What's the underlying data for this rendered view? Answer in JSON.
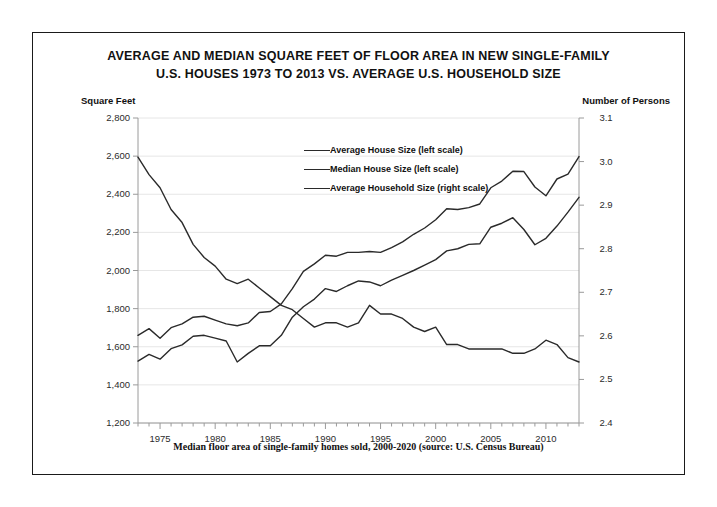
{
  "title": {
    "line1": "AVERAGE AND MEDIAN SQUARE FEET OF FLOOR AREA IN NEW SINGLE-FAMILY",
    "line2": "U.S. HOUSES 1973 TO 2013 VS. AVERAGE U.S. HOUSEHOLD SIZE"
  },
  "axis_captions": {
    "left": "Square Feet",
    "right": "Number of Persons"
  },
  "footer": "Median floor area of single-family homes sold, 2000-2020 (source: U.S. Census Bureau)",
  "colors": {
    "line": "#2a2a2a",
    "grid": "#e6e6e6",
    "axis": "#9a9a9a",
    "frame": "#1a1a1a",
    "text": "#111111"
  },
  "chart_data": {
    "type": "line",
    "title": "AVERAGE AND MEDIAN SQUARE FEET OF FLOOR AREA IN NEW SINGLE-FAMILY U.S. HOUSES 1973 TO 2013 VS. AVERAGE U.S. HOUSEHOLD SIZE",
    "xlabel": "",
    "ylabel": "Square Feet",
    "y2label": "Number of Persons",
    "grid": true,
    "legend_position": "inside-top-center",
    "xlim": [
      1973,
      2013
    ],
    "ylim": [
      1200,
      2800
    ],
    "y2lim": [
      2.4,
      3.1
    ],
    "yticks": [
      "1,200",
      "1,400",
      "1,600",
      "1,800",
      "2,000",
      "2,200",
      "2,400",
      "2,600",
      "2,800"
    ],
    "ytick_values": [
      1200,
      1400,
      1600,
      1800,
      2000,
      2200,
      2400,
      2600,
      2800
    ],
    "y2ticks": [
      "2.4",
      "2.5",
      "2.6",
      "2.7",
      "2.8",
      "2.9",
      "3.0",
      "3.1"
    ],
    "y2tick_values": [
      2.4,
      2.5,
      2.6,
      2.7,
      2.8,
      2.9,
      3.0,
      3.1
    ],
    "xticks": [
      "1975",
      "1980",
      "1985",
      "1990",
      "1995",
      "2000",
      "2005",
      "2010"
    ],
    "xtick_values": [
      1975,
      1980,
      1985,
      1990,
      1995,
      2000,
      2005,
      2010
    ],
    "x": [
      1973,
      1974,
      1975,
      1976,
      1977,
      1978,
      1979,
      1980,
      1981,
      1982,
      1983,
      1984,
      1985,
      1986,
      1987,
      1988,
      1989,
      1990,
      1991,
      1992,
      1993,
      1994,
      1995,
      1996,
      1997,
      1998,
      1999,
      2000,
      2001,
      2002,
      2003,
      2004,
      2005,
      2006,
      2007,
      2008,
      2009,
      2010,
      2011,
      2012,
      2013
    ],
    "series": [
      {
        "name": "Average House Size (left scale)",
        "axis": "left",
        "units": "square feet",
        "values": [
          1660,
          1695,
          1645,
          1700,
          1720,
          1755,
          1760,
          1740,
          1720,
          1710,
          1725,
          1780,
          1785,
          1825,
          1905,
          1995,
          2035,
          2080,
          2075,
          2095,
          2095,
          2100,
          2095,
          2120,
          2150,
          2190,
          2223,
          2266,
          2324,
          2320,
          2330,
          2349,
          2434,
          2469,
          2521,
          2519,
          2438,
          2392,
          2480,
          2505,
          2598
        ],
        "points": [
          {
            "x": 1973,
            "y": 1660
          },
          {
            "x": 1974,
            "y": 1695
          },
          {
            "x": 1975,
            "y": 1645
          },
          {
            "x": 1976,
            "y": 1700
          },
          {
            "x": 1977,
            "y": 1720
          },
          {
            "x": 1978,
            "y": 1755
          },
          {
            "x": 1979,
            "y": 1760
          },
          {
            "x": 1980,
            "y": 1740
          },
          {
            "x": 1981,
            "y": 1720
          },
          {
            "x": 1982,
            "y": 1710
          },
          {
            "x": 1983,
            "y": 1725
          },
          {
            "x": 1984,
            "y": 1780
          },
          {
            "x": 1985,
            "y": 1785
          },
          {
            "x": 1986,
            "y": 1825
          },
          {
            "x": 1987,
            "y": 1905
          },
          {
            "x": 1988,
            "y": 1995
          },
          {
            "x": 1989,
            "y": 2035
          },
          {
            "x": 1990,
            "y": 2080
          },
          {
            "x": 1991,
            "y": 2075
          },
          {
            "x": 1992,
            "y": 2095
          },
          {
            "x": 1993,
            "y": 2095
          },
          {
            "x": 1994,
            "y": 2100
          },
          {
            "x": 1995,
            "y": 2095
          },
          {
            "x": 1996,
            "y": 2120
          },
          {
            "x": 1997,
            "y": 2150
          },
          {
            "x": 1998,
            "y": 2190
          },
          {
            "x": 1999,
            "y": 2223
          },
          {
            "x": 2000,
            "y": 2266
          },
          {
            "x": 2001,
            "y": 2324
          },
          {
            "x": 2002,
            "y": 2320
          },
          {
            "x": 2003,
            "y": 2330
          },
          {
            "x": 2004,
            "y": 2349
          },
          {
            "x": 2005,
            "y": 2434
          },
          {
            "x": 2006,
            "y": 2469
          },
          {
            "x": 2007,
            "y": 2521
          },
          {
            "x": 2008,
            "y": 2519
          },
          {
            "x": 2009,
            "y": 2438
          },
          {
            "x": 2010,
            "y": 2392
          },
          {
            "x": 2011,
            "y": 2480
          },
          {
            "x": 2012,
            "y": 2505
          },
          {
            "x": 2013,
            "y": 2598
          }
        ]
      },
      {
        "name": "Median House Size (left scale)",
        "axis": "left",
        "units": "square feet",
        "values": [
          1525,
          1560,
          1535,
          1590,
          1610,
          1655,
          1660,
          1645,
          1630,
          1520,
          1565,
          1605,
          1605,
          1660,
          1755,
          1810,
          1850,
          1905,
          1890,
          1920,
          1945,
          1940,
          1920,
          1950,
          1975,
          2000,
          2028,
          2057,
          2103,
          2114,
          2137,
          2140,
          2227,
          2248,
          2277,
          2215,
          2135,
          2169,
          2233,
          2306,
          2384
        ],
        "points": [
          {
            "x": 1973,
            "y": 1525
          },
          {
            "x": 1974,
            "y": 1560
          },
          {
            "x": 1975,
            "y": 1535
          },
          {
            "x": 1976,
            "y": 1590
          },
          {
            "x": 1977,
            "y": 1610
          },
          {
            "x": 1978,
            "y": 1655
          },
          {
            "x": 1979,
            "y": 1660
          },
          {
            "x": 1980,
            "y": 1645
          },
          {
            "x": 1981,
            "y": 1630
          },
          {
            "x": 1982,
            "y": 1520
          },
          {
            "x": 1983,
            "y": 1565
          },
          {
            "x": 1984,
            "y": 1605
          },
          {
            "x": 1985,
            "y": 1605
          },
          {
            "x": 1986,
            "y": 1660
          },
          {
            "x": 1987,
            "y": 1755
          },
          {
            "x": 1988,
            "y": 1810
          },
          {
            "x": 1989,
            "y": 1850
          },
          {
            "x": 1990,
            "y": 1905
          },
          {
            "x": 1991,
            "y": 1890
          },
          {
            "x": 1992,
            "y": 1920
          },
          {
            "x": 1993,
            "y": 1945
          },
          {
            "x": 1994,
            "y": 1940
          },
          {
            "x": 1995,
            "y": 1920
          },
          {
            "x": 1996,
            "y": 1950
          },
          {
            "x": 1997,
            "y": 1975
          },
          {
            "x": 1998,
            "y": 2000
          },
          {
            "x": 1999,
            "y": 2028
          },
          {
            "x": 2000,
            "y": 2057
          },
          {
            "x": 2001,
            "y": 2103
          },
          {
            "x": 2002,
            "y": 2114
          },
          {
            "x": 2003,
            "y": 2137
          },
          {
            "x": 2004,
            "y": 2140
          },
          {
            "x": 2005,
            "y": 2227
          },
          {
            "x": 2006,
            "y": 2248
          },
          {
            "x": 2007,
            "y": 2277
          },
          {
            "x": 2008,
            "y": 2215
          },
          {
            "x": 2009,
            "y": 2135
          },
          {
            "x": 2010,
            "y": 2169
          },
          {
            "x": 2011,
            "y": 2233
          },
          {
            "x": 2012,
            "y": 2306
          },
          {
            "x": 2013,
            "y": 2384
          }
        ]
      },
      {
        "name": "Average Household Size (right scale)",
        "axis": "right",
        "units": "persons",
        "values": [
          3.01,
          2.97,
          2.94,
          2.89,
          2.86,
          2.81,
          2.78,
          2.76,
          2.73,
          2.72,
          2.73,
          2.71,
          2.69,
          2.67,
          2.66,
          2.64,
          2.62,
          2.63,
          2.63,
          2.62,
          2.63,
          2.67,
          2.65,
          2.65,
          2.64,
          2.62,
          2.61,
          2.62,
          2.58,
          2.58,
          2.57,
          2.57,
          2.57,
          2.57,
          2.56,
          2.56,
          2.57,
          2.59,
          2.58,
          2.55,
          2.54
        ],
        "points": [
          {
            "x": 1973,
            "y": 3.01
          },
          {
            "x": 1974,
            "y": 2.97
          },
          {
            "x": 1975,
            "y": 2.94
          },
          {
            "x": 1976,
            "y": 2.89
          },
          {
            "x": 1977,
            "y": 2.86
          },
          {
            "x": 1978,
            "y": 2.81
          },
          {
            "x": 1979,
            "y": 2.78
          },
          {
            "x": 1980,
            "y": 2.76
          },
          {
            "x": 1981,
            "y": 2.73
          },
          {
            "x": 1982,
            "y": 2.72
          },
          {
            "x": 1983,
            "y": 2.73
          },
          {
            "x": 1984,
            "y": 2.71
          },
          {
            "x": 1985,
            "y": 2.69
          },
          {
            "x": 1986,
            "y": 2.67
          },
          {
            "x": 1987,
            "y": 2.66
          },
          {
            "x": 1988,
            "y": 2.64
          },
          {
            "x": 1989,
            "y": 2.62
          },
          {
            "x": 1990,
            "y": 2.63
          },
          {
            "x": 1991,
            "y": 2.63
          },
          {
            "x": 1992,
            "y": 2.62
          },
          {
            "x": 1993,
            "y": 2.63
          },
          {
            "x": 1994,
            "y": 2.67
          },
          {
            "x": 1995,
            "y": 2.65
          },
          {
            "x": 1996,
            "y": 2.65
          },
          {
            "x": 1997,
            "y": 2.64
          },
          {
            "x": 1998,
            "y": 2.62
          },
          {
            "x": 1999,
            "y": 2.61
          },
          {
            "x": 2000,
            "y": 2.62
          },
          {
            "x": 2001,
            "y": 2.58
          },
          {
            "x": 2002,
            "y": 2.58
          },
          {
            "x": 2003,
            "y": 2.57
          },
          {
            "x": 2004,
            "y": 2.57
          },
          {
            "x": 2005,
            "y": 2.57
          },
          {
            "x": 2006,
            "y": 2.57
          },
          {
            "x": 2007,
            "y": 2.56
          },
          {
            "x": 2008,
            "y": 2.56
          },
          {
            "x": 2009,
            "y": 2.57
          },
          {
            "x": 2010,
            "y": 2.59
          },
          {
            "x": 2011,
            "y": 2.58
          },
          {
            "x": 2012,
            "y": 2.55
          },
          {
            "x": 2013,
            "y": 2.54
          }
        ]
      }
    ]
  }
}
